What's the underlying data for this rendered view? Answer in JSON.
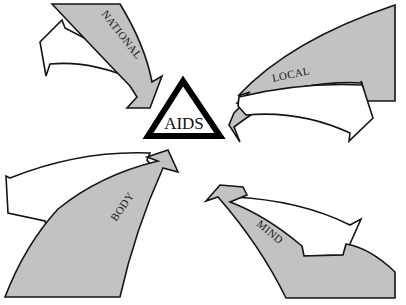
{
  "diagram": {
    "center": {
      "label": "AIDS",
      "shape": "triangle"
    },
    "arrows": [
      {
        "label": "NATIONAL",
        "position": "top-left",
        "direction": "inward-to-center",
        "return_arrow": "outward-white"
      },
      {
        "label": "LOCAL",
        "position": "top-right",
        "direction": "inward-to-center",
        "return_arrow": "outward-white"
      },
      {
        "label": "BODY",
        "position": "bottom-left",
        "direction": "inward-to-center",
        "return_arrow": "outward-white"
      },
      {
        "label": "MIND",
        "position": "bottom-right",
        "direction": "inward-to-center",
        "return_arrow": "outward-white"
      }
    ],
    "colors": {
      "inward_fill": "#c2c2c2",
      "outward_fill": "#ffffff",
      "outline": "#151515",
      "triangle_stroke": "#000000"
    }
  }
}
